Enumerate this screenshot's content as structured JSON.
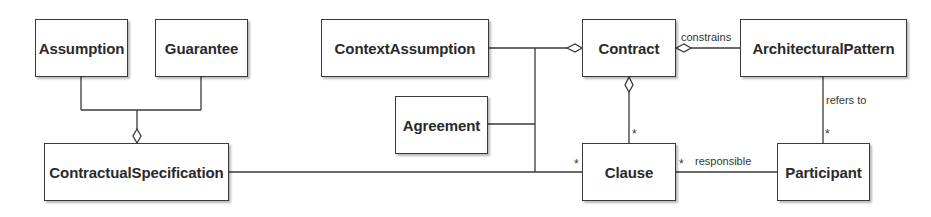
{
  "diagram": {
    "type": "uml-class-diagram",
    "classes": {
      "assumption": "Assumption",
      "guarantee": "Guarantee",
      "contractual_specification": "ContractualSpecification",
      "context_assumption": "ContextAssumption",
      "agreement": "Agreement",
      "contract": "Contract",
      "architectural_pattern": "ArchitecturalPattern",
      "clause": "Clause",
      "participant": "Participant"
    },
    "associations": {
      "constrains": "constrains",
      "refers_to": "refers to",
      "responsible": "responsible"
    },
    "multiplicities": {
      "contract_clause": "*",
      "spec_clause": "*",
      "clause_participant": "*",
      "pattern_participant": "*"
    },
    "relations": [
      {
        "from": "Assumption",
        "to": "ContractualSpecification",
        "kind": "aggregation"
      },
      {
        "from": "Guarantee",
        "to": "ContractualSpecification",
        "kind": "aggregation"
      },
      {
        "from": "ContextAssumption",
        "to": "Contract",
        "kind": "aggregation"
      },
      {
        "from": "Agreement",
        "to": "Contract",
        "kind": "aggregation"
      },
      {
        "from": "ArchitecturalPattern",
        "to": "Contract",
        "kind": "aggregation",
        "label": "constrains"
      },
      {
        "from": "Clause",
        "to": "Contract",
        "kind": "aggregation",
        "multiplicity": "*"
      },
      {
        "from": "ContractualSpecification",
        "to": "Clause",
        "kind": "association",
        "multiplicity": "*"
      },
      {
        "from": "Clause",
        "to": "Participant",
        "kind": "association",
        "label": "responsible",
        "multiplicity": "*"
      },
      {
        "from": "ArchitecturalPattern",
        "to": "Participant",
        "kind": "association",
        "label": "refers to",
        "multiplicity": "*"
      }
    ],
    "colors": {
      "line": "#3a3a3a",
      "text": "#2a2a2a",
      "background": "#ffffff"
    }
  }
}
